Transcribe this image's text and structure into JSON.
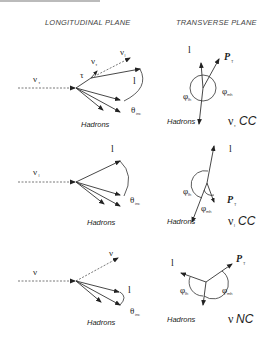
{
  "header_cut_text": "...",
  "column_headers": {
    "longitudinal": "LONGITUDINAL PLANE",
    "transverse": "TRANSVERSE PLANE"
  },
  "panels": [
    {
      "id": "nu-tau-cc",
      "longitudinal": {
        "incoming": "ν",
        "incoming_sub": "τ",
        "tau_label": "τ",
        "nu_tau_label": "ν",
        "nu_tau_sub": "τ",
        "nu_l_label": "ν",
        "nu_l_sub": "l",
        "lepton_label": "l",
        "angle_label": "θ",
        "angle_sub": "inc",
        "hadrons_label": "Hadrons"
      },
      "transverse": {
        "lepton_label": "l",
        "pt_label": "P",
        "pt_sub": "T",
        "phi_lh_label": "φ",
        "phi_lh_sub": "lh",
        "phi_mh_label": "φ",
        "phi_mh_sub": "mh",
        "hadrons_label": "Hadrons",
        "process_nu": "ν",
        "process_sub": "τ",
        "process_label": "CC"
      }
    },
    {
      "id": "nu-l-cc",
      "longitudinal": {
        "incoming": "ν",
        "incoming_sub": "l",
        "lepton_label": "l",
        "angle_label": "θ",
        "angle_sub": "inc",
        "hadrons_label": "Hadrons"
      },
      "transverse": {
        "lepton_label": "l",
        "pt_label": "P",
        "pt_sub": "T",
        "phi_lh_label": "φ",
        "phi_lh_sub": "lh",
        "phi_mh_label": "φ",
        "phi_mh_sub": "mh",
        "hadrons_label": "Hadrons",
        "process_nu": "ν",
        "process_sub": "l",
        "process_label": "CC"
      }
    },
    {
      "id": "nu-nc",
      "longitudinal": {
        "incoming": "ν",
        "outgoing": "ν",
        "lepton_label": "l",
        "angle_label": "θ",
        "angle_sub": "inc",
        "hadrons_label": "Hadrons"
      },
      "transverse": {
        "lepton_label": "l",
        "pt_label": "P",
        "pt_sub": "T",
        "phi_lh_label": "φ",
        "phi_lh_sub": "lh",
        "phi_mh_label": "φ",
        "phi_mh_sub": "mh",
        "hadrons_label": "Hadrons",
        "process_nu": "ν",
        "process_label": "NC"
      }
    }
  ],
  "colors": {
    "ink": "#222222",
    "header": "#444444",
    "background": "#ffffff"
  }
}
